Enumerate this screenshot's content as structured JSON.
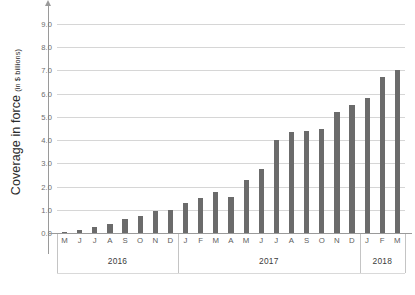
{
  "axis": {
    "y_title_main": "Coverage in force",
    "y_title_sub": "(in $ billions)"
  },
  "chart_data": {
    "type": "bar",
    "title": "",
    "subtitle": "",
    "xlabel": "",
    "ylabel": "Coverage in force (in $ billions)",
    "ylim": [
      0.0,
      9.0
    ],
    "ytick_labels": [
      "9.0",
      "8.0",
      "7.0",
      "6.0",
      "5.0",
      "4.0",
      "3.0",
      "2.0",
      "1.0",
      "0.0"
    ],
    "ytick_values": [
      9.0,
      8.0,
      7.0,
      6.0,
      5.0,
      4.0,
      3.0,
      2.0,
      1.0,
      0.0
    ],
    "grid": true,
    "legend": "none",
    "bar_color": "#6b6b6b",
    "gridline_color": "#d6d6d6",
    "categories": [
      "M",
      "J",
      "J",
      "A",
      "S",
      "O",
      "N",
      "D",
      "J",
      "F",
      "M",
      "A",
      "M",
      "J",
      "J",
      "A",
      "S",
      "O",
      "N",
      "D",
      "J",
      "F",
      "M"
    ],
    "values": [
      0.05,
      0.15,
      0.25,
      0.4,
      0.6,
      0.75,
      0.95,
      1.0,
      1.3,
      1.5,
      1.75,
      1.55,
      2.3,
      2.75,
      4.0,
      4.35,
      4.4,
      4.5,
      5.2,
      5.5,
      5.8,
      6.7,
      7.0
    ],
    "groups": [
      {
        "label": "2016",
        "count": 8
      },
      {
        "label": "2017",
        "count": 12
      },
      {
        "label": "2018",
        "count": 3
      }
    ]
  }
}
